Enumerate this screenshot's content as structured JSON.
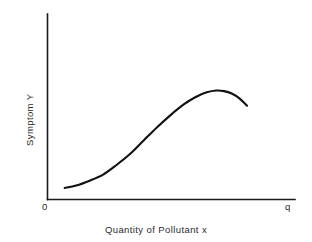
{
  "chart_data": {
    "type": "line",
    "title": "",
    "subtitle": "",
    "xlabel": "Quantity of Pollutant  x",
    "ylabel": "Symptom Y",
    "x_tick_labels": [
      "0",
      "q"
    ],
    "y_tick_labels": [],
    "grid": false,
    "legend": null,
    "legend_position": "none",
    "axis_style": "open-L-shaped (left spine and bottom spine only)",
    "xlim": [
      0,
      1
    ],
    "ylim": [
      0,
      1
    ],
    "series": [
      {
        "name": "Dose-response curve",
        "shape": "sigmoid rise to a maximum then gentle decline",
        "x": [
          0.04,
          0.1,
          0.17,
          0.24,
          0.31,
          0.38,
          0.45,
          0.52,
          0.59,
          0.66,
          0.72,
          0.78,
          0.83,
          0.87,
          0.91,
          0.95,
          0.99
        ],
        "y": [
          0.05,
          0.07,
          0.11,
          0.16,
          0.24,
          0.33,
          0.44,
          0.55,
          0.65,
          0.74,
          0.8,
          0.84,
          0.855,
          0.85,
          0.83,
          0.79,
          0.73
        ]
      }
    ],
    "annotations": [],
    "colors": {
      "curve": "#111111",
      "axis": "#1a1a1a",
      "text": "#2b2b2b",
      "background": "#ffffff"
    }
  },
  "figure": {
    "axis_origin_label": "0",
    "axis_max_label": "q",
    "x_axis_title": "Quantity of Pollutant  x",
    "y_axis_title": "Symptom Y"
  }
}
